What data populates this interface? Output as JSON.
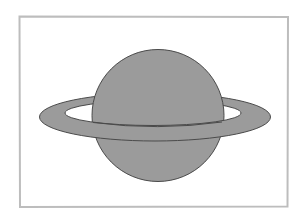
{
  "illustration": {
    "subject": "Saturn planet with ring",
    "frame_color": "#bdbdbd",
    "planet_color": "#9b9b9b",
    "outline_color": "#4a4a4a",
    "background_color": "#ffffff"
  }
}
